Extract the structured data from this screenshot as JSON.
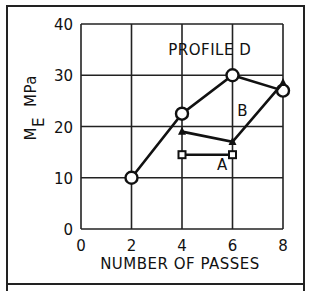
{
  "chart_data": {
    "type": "line",
    "title": "",
    "xlabel": "NUMBER OF PASSES",
    "ylabel": "M_E MPa",
    "ylabel_main": "M",
    "ylabel_sub": "E",
    "ylabel_unit": "MPa",
    "xlim": [
      0,
      8
    ],
    "ylim": [
      0,
      40
    ],
    "xticks": [
      "0",
      "2",
      "4",
      "6",
      "8"
    ],
    "yticks": [
      "0",
      "10",
      "20",
      "30",
      "40"
    ],
    "grid": true,
    "annotations": [
      {
        "text": "PROFILE D",
        "x": 5.1,
        "y": 34
      },
      {
        "text": "B",
        "x": 6.4,
        "y": 22
      },
      {
        "text": "A",
        "x": 5.6,
        "y": 11.5
      }
    ],
    "series": [
      {
        "name": "Profile D",
        "marker": "circle",
        "x": [
          2,
          4,
          6,
          8
        ],
        "y": [
          10,
          22.5,
          30,
          27
        ]
      },
      {
        "name": "Profile B",
        "marker": "triangle",
        "x": [
          4,
          6,
          8
        ],
        "y": [
          19,
          17,
          28.5
        ]
      },
      {
        "name": "Profile A",
        "marker": "square",
        "x": [
          4,
          6
        ],
        "y": [
          14.5,
          14.5
        ]
      }
    ]
  }
}
